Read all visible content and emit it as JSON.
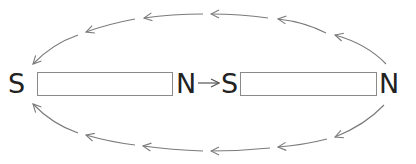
{
  "diagram": {
    "type": "magnetic-field-lines",
    "colors": {
      "text": "#222222",
      "magnet_outline": "#8a8a8a",
      "field_lines": "#7a7a7a",
      "center_arrow": "#555555",
      "background": "#ffffff"
    },
    "magnets": [
      {
        "id": "left",
        "south_label": "S",
        "north_label": "N"
      },
      {
        "id": "right",
        "south_label": "S",
        "north_label": "N"
      }
    ],
    "center_arrow": {
      "direction": "right",
      "from": "left-magnet-N",
      "to": "right-magnet-S"
    },
    "field_loops": [
      {
        "id": "top",
        "path": "over",
        "direction": "right-N to left-S",
        "arrowheads": 5
      },
      {
        "id": "bottom",
        "path": "under",
        "direction": "right-N to left-S",
        "arrowheads": 6
      }
    ]
  }
}
